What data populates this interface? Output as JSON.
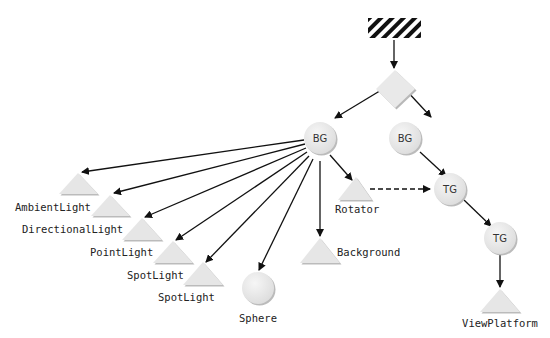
{
  "diagram": {
    "type": "scene-graph",
    "colors": {
      "node_fill": "#e8e8e8",
      "node_shadow": "#b8b8b8",
      "edge": "#111111",
      "hatch": "#111111"
    },
    "nodes": {
      "locale": {
        "kind": "virtual-universe-locale",
        "label": ""
      },
      "root": {
        "kind": "diamond",
        "label": ""
      },
      "bg_left": {
        "kind": "circle",
        "label": "BG"
      },
      "bg_right": {
        "kind": "circle",
        "label": "BG"
      },
      "tg_top": {
        "kind": "circle",
        "label": "TG"
      },
      "tg_bottom": {
        "kind": "circle",
        "label": "TG"
      },
      "ambient": {
        "kind": "triangle",
        "label": "AmbientLight"
      },
      "directional": {
        "kind": "triangle",
        "label": "DirectionalLight"
      },
      "point": {
        "kind": "triangle",
        "label": "PointLight"
      },
      "spot1": {
        "kind": "triangle",
        "label": "SpotLight"
      },
      "spot2": {
        "kind": "triangle",
        "label": "SpotLight"
      },
      "sphere": {
        "kind": "sphere",
        "label": "Sphere"
      },
      "background": {
        "kind": "triangle",
        "label": "Background"
      },
      "rotator": {
        "kind": "triangle",
        "label": "Rotator"
      },
      "viewplatform": {
        "kind": "triangle",
        "label": "ViewPlatform"
      }
    },
    "edges": [
      {
        "from": "locale",
        "to": "root",
        "style": "solid"
      },
      {
        "from": "root",
        "to": "bg_left",
        "style": "solid"
      },
      {
        "from": "root",
        "to": "bg_right",
        "style": "solid"
      },
      {
        "from": "bg_left",
        "to": "ambient",
        "style": "solid"
      },
      {
        "from": "bg_left",
        "to": "directional",
        "style": "solid"
      },
      {
        "from": "bg_left",
        "to": "point",
        "style": "solid"
      },
      {
        "from": "bg_left",
        "to": "spot1",
        "style": "solid"
      },
      {
        "from": "bg_left",
        "to": "spot2",
        "style": "solid"
      },
      {
        "from": "bg_left",
        "to": "sphere",
        "style": "solid"
      },
      {
        "from": "bg_left",
        "to": "background",
        "style": "solid"
      },
      {
        "from": "bg_left",
        "to": "rotator",
        "style": "solid"
      },
      {
        "from": "rotator",
        "to": "tg_top",
        "style": "dashed"
      },
      {
        "from": "bg_right",
        "to": "tg_top",
        "style": "solid"
      },
      {
        "from": "tg_top",
        "to": "tg_bottom",
        "style": "solid"
      },
      {
        "from": "tg_bottom",
        "to": "viewplatform",
        "style": "solid"
      }
    ]
  }
}
